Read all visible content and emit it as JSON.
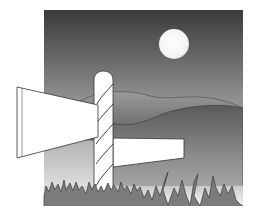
{
  "illustration": {
    "subject": "signpost in moonlit hilly landscape",
    "colors": {
      "background": "#ffffff",
      "sky_top": "#3a3a3a",
      "sky_bottom": "#e8e8e8",
      "moon": "#ffffff",
      "hill_back": "#8a8a8a",
      "hill_front": "#6e6e6e",
      "sign": "#ffffff",
      "outline": "#333333",
      "grass": "#7a7a7a"
    },
    "elements": [
      "sky",
      "moon",
      "hills",
      "signpost",
      "left-sign-board",
      "right-sign-board",
      "grass"
    ]
  }
}
